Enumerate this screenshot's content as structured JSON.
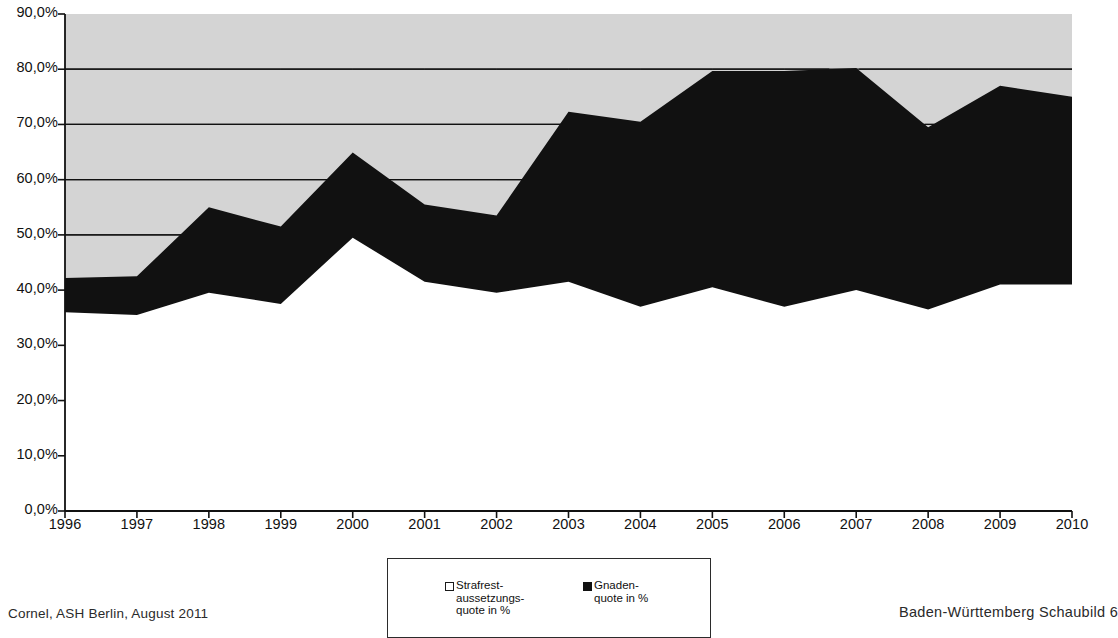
{
  "chart_data": {
    "type": "area",
    "title": "",
    "subtitle": "",
    "xlabel": "",
    "ylabel": "",
    "stacked": true,
    "grid": true,
    "legend_position": "bottom",
    "categories": [
      "1996",
      "1997",
      "1998",
      "1999",
      "2000",
      "2001",
      "2002",
      "2003",
      "2004",
      "2005",
      "2006",
      "2007",
      "2008",
      "2009",
      "2010"
    ],
    "ylim": [
      0,
      90
    ],
    "ytick_labels": [
      "0,0%",
      "10,0%",
      "20,0%",
      "30,0%",
      "40,0%",
      "50,0%",
      "60,0%",
      "70,0%",
      "80,0%",
      "90,0%"
    ],
    "ytick_values": [
      0,
      10,
      20,
      30,
      40,
      50,
      60,
      70,
      80,
      90
    ],
    "series": [
      {
        "name": "Strafrest-\naussetzungs-\nquote in %",
        "key": "strafrestaussetzungsquote",
        "color": "#ffffff",
        "swatch": "hollow",
        "values": [
          36.0,
          35.5,
          39.5,
          37.5,
          49.5,
          41.5,
          39.5,
          41.5,
          37.0,
          40.5,
          37.0,
          40.0,
          36.5,
          41.0,
          41.0
        ]
      },
      {
        "name": "Gnaden-\nquote in %",
        "key": "gnadenquote",
        "color": "#111111",
        "swatch": "filled",
        "values": [
          6.2,
          7.0,
          15.5,
          14.0,
          15.4,
          14.0,
          14.0,
          30.8,
          33.5,
          39.2,
          42.7,
          40.2,
          33.0,
          36.0,
          34.0
        ]
      }
    ],
    "cumulative_totals": [
      42.2,
      42.5,
      55.0,
      51.5,
      64.9,
      55.5,
      53.5,
      72.3,
      70.5,
      79.7,
      79.7,
      80.2,
      69.5,
      77.0,
      75.0
    ],
    "plot_background": "#d4d4d4",
    "axis_color": "#111111"
  },
  "legend": {
    "entries": [
      {
        "label": "Strafrest-\naussetzungs-\nquote in %",
        "swatch": "hollow"
      },
      {
        "label": "Gnaden-\nquote in %",
        "swatch": "filled"
      }
    ]
  },
  "footer": {
    "left": "Cornel, ASH Berlin, August 2011",
    "right": "Baden-Württemberg Schaubild 6"
  }
}
